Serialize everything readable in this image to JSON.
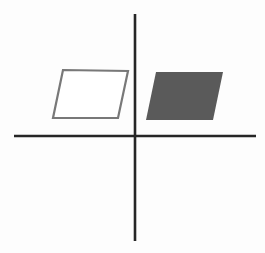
{
  "figure": {
    "background_color": "#fdfdfd",
    "width": 265,
    "height": 253
  },
  "axes": {
    "color": "#262626",
    "stroke_width": 2.6,
    "origin": {
      "x": 135,
      "y": 136
    },
    "x_axis": {
      "label": "horizontal-axis",
      "x1": 14,
      "y1": 136,
      "x2": 256,
      "y2": 136
    },
    "y_axis": {
      "label": "vertical-axis",
      "x1": 135,
      "y1": 14,
      "x2": 135,
      "y2": 241
    }
  },
  "shapes": [
    {
      "name": "outlined-parallelogram",
      "style": "outline",
      "quadrant": "II",
      "fill_color": "#ffffff",
      "stroke_color": "#787878",
      "stroke_width": 2.2,
      "points": "63,70 128,71 118,118 53,118",
      "vertices": [
        {
          "x": 63,
          "y": 70
        },
        {
          "x": 128,
          "y": 71
        },
        {
          "x": 118,
          "y": 118
        },
        {
          "x": 53,
          "y": 118
        }
      ]
    },
    {
      "name": "filled-parallelogram",
      "style": "filled",
      "quadrant": "I",
      "fill_color": "#5a5a5a",
      "stroke_color": "none",
      "stroke_width": 0,
      "points": "156,72 223,72 213,120 146,120",
      "vertices": [
        {
          "x": 156,
          "y": 72
        },
        {
          "x": 223,
          "y": 72
        },
        {
          "x": 213,
          "y": 120
        },
        {
          "x": 146,
          "y": 120
        }
      ]
    }
  ]
}
